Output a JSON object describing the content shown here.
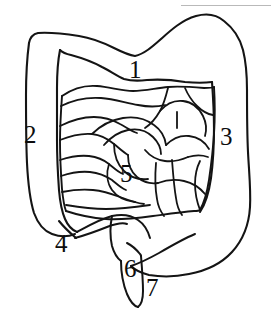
{
  "figure": {
    "type": "anatomical-line-drawing",
    "background_color": "#ffffff",
    "ink_color": "#111111",
    "artifact_color": "#b9b9b9",
    "width": 271,
    "height": 332
  },
  "labels": [
    {
      "id": "1",
      "text": "1",
      "x": 129,
      "y": 57,
      "region": "transverse-colon"
    },
    {
      "id": "2",
      "text": "2",
      "x": 24,
      "y": 122,
      "region": "ascending-colon"
    },
    {
      "id": "3",
      "text": "3",
      "x": 220,
      "y": 124,
      "region": "descending-colon"
    },
    {
      "id": "4",
      "text": "4",
      "x": 55,
      "y": 231,
      "region": "cecum-appendix-left"
    },
    {
      "id": "5",
      "text": "5",
      "x": 120,
      "y": 161,
      "region": "small-intestine-loops"
    },
    {
      "id": "6",
      "text": "6",
      "x": 124,
      "y": 256,
      "region": "cecum"
    },
    {
      "id": "7",
      "text": "7",
      "x": 146,
      "y": 275,
      "region": "appendix"
    }
  ],
  "artifact": {
    "top_edge_line": {
      "x": 181,
      "y": 5,
      "width": 90
    }
  }
}
